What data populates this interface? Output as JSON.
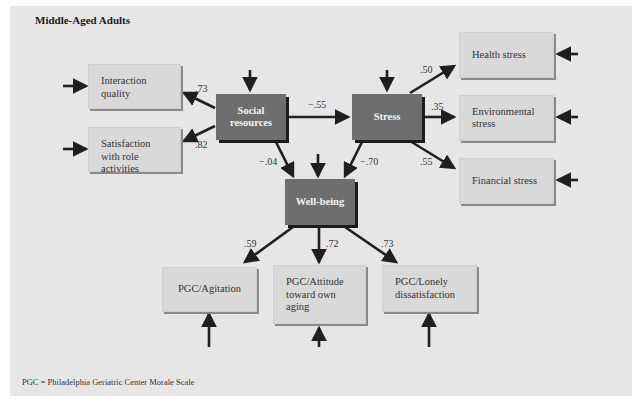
{
  "title": "Middle-Aged Adults",
  "footnote": "PGC = Philadelphia Geriatric Center Morale Scale",
  "nodes": {
    "interaction_quality": "Interaction quality",
    "satisfaction_role": "Satisfaction with role activities",
    "social_resources": "Social resources",
    "stress": "Stress",
    "well_being": "Well-being",
    "health_stress": "Health stress",
    "environmental_stress": "Environmental stress",
    "financial_stress": "Financial stress",
    "pgc_agitation": "PGC/Agitation",
    "pgc_attitude": "PGC/Attitude toward own aging",
    "pgc_lonely": "PGC/Lonely dissatisfaction"
  },
  "edges": [
    {
      "from": "social_resources",
      "to": "interaction_quality",
      "label": ".73"
    },
    {
      "from": "social_resources",
      "to": "satisfaction_role",
      "label": ".82"
    },
    {
      "from": "social_resources",
      "to": "stress",
      "label": "−.55"
    },
    {
      "from": "social_resources",
      "to": "well_being",
      "label": "−.04"
    },
    {
      "from": "stress",
      "to": "well_being",
      "label": "−.70"
    },
    {
      "from": "stress",
      "to": "health_stress",
      "label": ".50"
    },
    {
      "from": "stress",
      "to": "environmental_stress",
      "label": ".35"
    },
    {
      "from": "stress",
      "to": "financial_stress",
      "label": ".55"
    },
    {
      "from": "well_being",
      "to": "pgc_agitation",
      "label": ".59"
    },
    {
      "from": "well_being",
      "to": "pgc_attitude",
      "label": ".72"
    },
    {
      "from": "well_being",
      "to": "pgc_lonely",
      "label": ".73"
    }
  ],
  "colors": {
    "background": "#e6e6e6",
    "light_box": "#d9d9d9",
    "dark_box": "#6e6e6e",
    "arrow": "#1f1f1f"
  }
}
